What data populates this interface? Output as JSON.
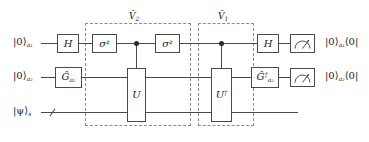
{
  "diagram": {
    "wire_color": "#4a4a4a",
    "dash_color": "#8a8a8a",
    "dot_color": "#2b2b2b"
  },
  "groups": [
    {
      "name": "v2-group",
      "label_base": "V",
      "label_hat": "ˆ",
      "label_sub": "2"
    },
    {
      "name": "v1-group",
      "label_base": "V",
      "label_hat": "ˆ",
      "label_sub": "1"
    }
  ],
  "wires": [
    {
      "name": "ancilla-1",
      "input_ket": "|0⟩",
      "input_sub": "a₁",
      "output": "|0⟩",
      "output_sub": "a₁",
      "output_bra": "⟨0|"
    },
    {
      "name": "ancilla-2",
      "input_ket": "|0⟩",
      "input_sub": "a₂",
      "output": "|0⟩",
      "output_sub": "a₂",
      "output_bra": "⟨0|"
    },
    {
      "name": "system",
      "input_ket": "|ψ⟩",
      "input_sub": "s",
      "output": "",
      "output_sub": "",
      "output_bra": ""
    }
  ],
  "gates": {
    "h_left": "H",
    "h_right": "H",
    "sigma_z_left": "σ",
    "sigma_z_left_sup": "z",
    "sigma_z_right": "σ",
    "sigma_z_right_sup": "z",
    "g": "G",
    "g_hat": "ˆ",
    "g_sub": "a₂",
    "g_dagger": "G",
    "g_dagger_hat": "ˆ",
    "g_dagger_sup": "†",
    "g_dagger_sub": "a₂",
    "u": "U",
    "u_dagger": "U",
    "u_dagger_sup": "†"
  },
  "icons": {
    "meter_top": "measurement-meter-icon",
    "meter_bottom": "measurement-meter-icon",
    "bundle_slash": "multi-qubit-bundle-slash-icon"
  }
}
